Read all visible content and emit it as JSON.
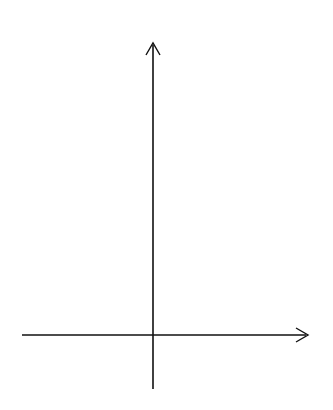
{
  "axes": {
    "x_label": "x",
    "y_label": "y",
    "x_ticks": [
      "−4",
      "−3",
      "−2",
      "−1",
      "1",
      "2",
      "3",
      "4"
    ],
    "x_tick_values": [
      -4,
      -3,
      -2,
      -1,
      1,
      2,
      3,
      4
    ],
    "y_ticks": [
      "9",
      "8",
      "7",
      "6",
      "5",
      "4",
      "3",
      "2",
      "1",
      "−1"
    ],
    "y_tick_values": [
      9,
      8,
      7,
      6,
      5,
      4,
      3,
      2,
      1,
      -1
    ]
  },
  "grid": {
    "x_range": [
      -5,
      5
    ],
    "y_range": [
      -2,
      10
    ],
    "style": "dotted",
    "color": "#8a8a8a"
  },
  "chart_data": {
    "type": "line",
    "xlabel": "x",
    "ylabel": "y",
    "xlim": [
      -5,
      5
    ],
    "ylim": [
      -2,
      10
    ],
    "grid": true,
    "series": [],
    "x_tick_labels": [
      "-4",
      "-3",
      "-2",
      "-1",
      "1",
      "2",
      "3",
      "4"
    ],
    "y_tick_labels": [
      "-1",
      "1",
      "2",
      "3",
      "4",
      "5",
      "6",
      "7",
      "8",
      "9"
    ]
  }
}
